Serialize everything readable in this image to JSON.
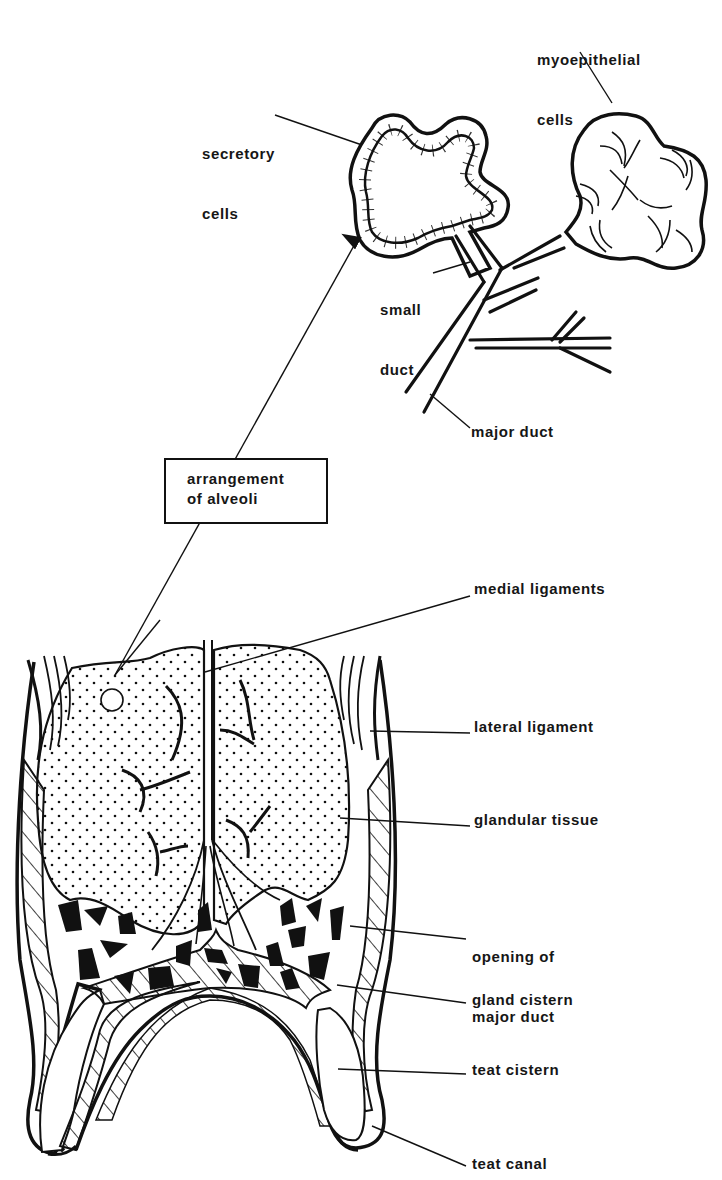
{
  "figure": {
    "colors": {
      "ink": "#111111",
      "paper": "#ffffff"
    }
  },
  "labels": {
    "myoepithelial": [
      "myoepithelial",
      "cells"
    ],
    "secretory": [
      "secretory",
      "cells"
    ],
    "small_duct": [
      "small",
      "duct"
    ],
    "major_duct": "major duct",
    "arrangement_box": [
      "arrangement",
      "of alveoli"
    ],
    "medial_ligaments": "medial ligaments",
    "lateral_ligament": "lateral ligament",
    "glandular_tissue": "glandular tissue",
    "opening_major_duct": [
      "opening of",
      "major duct"
    ],
    "gland_cistern": "gland cistern",
    "teat_cistern": "teat cistern",
    "teat_canal": "teat canal"
  }
}
